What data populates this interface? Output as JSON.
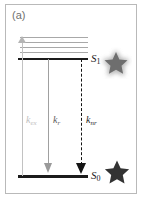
{
  "panel": {
    "label": "(a)",
    "type": "jablonski-energy-diagram",
    "background_color": "#ffffff",
    "border_color": "#b9b9b9"
  },
  "states": [
    {
      "id": "s1",
      "label_base": "S",
      "label_sub": "1",
      "name": "first-excited-singlet-state",
      "line_color": "#1b1b1b"
    },
    {
      "id": "s0",
      "label_base": "S",
      "label_sub": "0",
      "name": "ground-singlet-state",
      "line_color": "#1b1b1b"
    }
  ],
  "vibrational_levels": {
    "count": 4,
    "color": "#a8a8a8"
  },
  "transitions": [
    {
      "id": "k_ex",
      "label_base": "k",
      "label_sub": "ex",
      "name": "excitation",
      "direction": "up",
      "style": "solid",
      "color": "#c0c0c0"
    },
    {
      "id": "k_r",
      "label_base": "k",
      "label_sub": "r",
      "name": "radiative-decay",
      "direction": "down",
      "style": "solid",
      "color": "#5e5e5e"
    },
    {
      "id": "k_nr",
      "label_base": "k",
      "label_sub": "nr",
      "name": "non-radiative-decay",
      "direction": "down",
      "style": "dashed",
      "color": "#1d1d1d"
    }
  ],
  "stars": [
    {
      "id": "excited-star",
      "name": "glowing-star-excited",
      "fill": "#6e6e6e",
      "glow": true,
      "glow_color": "#bdbdbd"
    },
    {
      "id": "ground-star",
      "name": "solid-star-ground",
      "fill": "#333333",
      "glow": false,
      "glow_color": "#333333"
    }
  ]
}
